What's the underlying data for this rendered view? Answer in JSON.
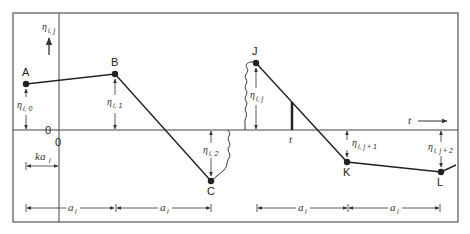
{
  "diagram": {
    "title": "",
    "frame": {
      "left": 13,
      "top": 13,
      "right": 458,
      "bottom": 222
    },
    "colors": {
      "stroke": "#333333",
      "background": "#ffffff",
      "text": "#222222"
    },
    "axis": {
      "zero_y": 130,
      "origin_x": 59,
      "zero_label_left": "0",
      "zero_label_origin": "0",
      "t_label_axis": "t",
      "t_label_arrow": "t"
    },
    "y_axis_label": {
      "symbol": "η",
      "subscript": "i, j"
    },
    "points": [
      {
        "id": "A",
        "label": "A",
        "x": 26,
        "y": 84
      },
      {
        "id": "B",
        "label": "B",
        "x": 115,
        "y": 74
      },
      {
        "id": "C",
        "label": "C",
        "x": 211,
        "y": 181
      },
      {
        "id": "J",
        "label": "J",
        "x": 256,
        "y": 63
      },
      {
        "id": "K",
        "label": "K",
        "x": 347,
        "y": 162
      },
      {
        "id": "L",
        "label": "L",
        "x": 441,
        "y": 172
      }
    ],
    "eta_labels": [
      {
        "symbol": "η",
        "subscript": "i, 0",
        "for": "A"
      },
      {
        "symbol": "η",
        "subscript": "i, 1",
        "for": "B"
      },
      {
        "symbol": "η",
        "subscript": "i, 2",
        "for": "C"
      },
      {
        "symbol": "η",
        "subscript": "i, j",
        "for": "J"
      },
      {
        "symbol": "η",
        "subscript": "i, j + 1",
        "for": "K"
      },
      {
        "symbol": "η",
        "subscript": "i, j + 2",
        "for": "L"
      }
    ],
    "interval_labels": {
      "ka": {
        "main": "ka",
        "subscript": "i"
      },
      "a1": {
        "main": "a",
        "subscript": "i"
      },
      "a2": {
        "main": "a",
        "subscript": "i"
      },
      "a3": {
        "main": "a",
        "subscript": "i"
      },
      "a4": {
        "main": "a",
        "subscript": "i"
      }
    }
  }
}
